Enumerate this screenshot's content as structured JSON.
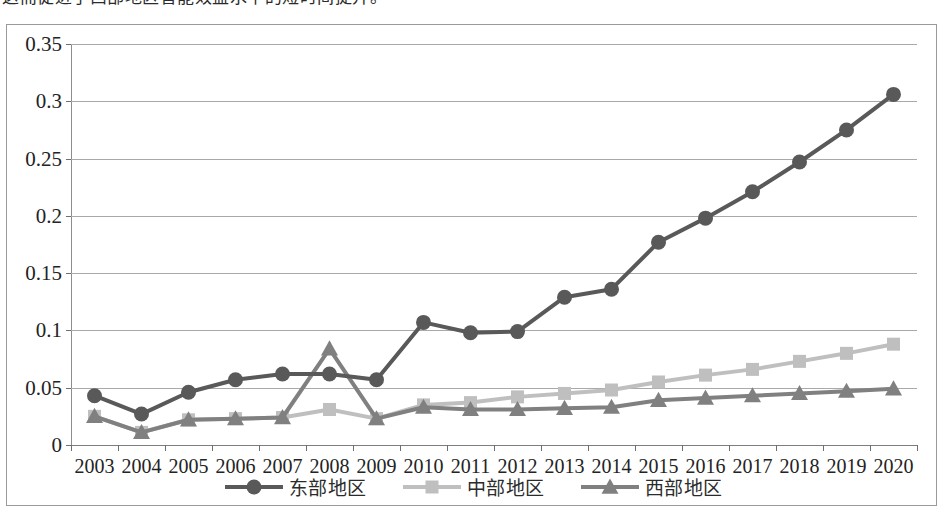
{
  "caption": {
    "text": "这而促进了西部地区智能效益水平的短时间提升。"
  },
  "chart_data": {
    "type": "line",
    "title": "",
    "xlabel": "",
    "ylabel": "",
    "x": [
      2003,
      2004,
      2005,
      2006,
      2007,
      2008,
      2009,
      2010,
      2011,
      2012,
      2013,
      2014,
      2015,
      2016,
      2017,
      2018,
      2019,
      2020
    ],
    "categories": [
      "2003",
      "2004",
      "2005",
      "2006",
      "2007",
      "2008",
      "2009",
      "2010",
      "2011",
      "2012",
      "2013",
      "2014",
      "2015",
      "2016",
      "2017",
      "2018",
      "2019",
      "2020"
    ],
    "ylim": [
      0,
      0.35
    ],
    "ytick_labels": [
      "0",
      "0.05",
      "0.1",
      "0.15",
      "0.2",
      "0.25",
      "0.3",
      "0.35"
    ],
    "ytick_values": [
      0,
      0.05,
      0.1,
      0.15,
      0.2,
      0.25,
      0.3,
      0.35
    ],
    "grid": true,
    "legend_position": "bottom",
    "series": [
      {
        "name": "东部地区",
        "marker": "circle",
        "color": "#595959",
        "values": [
          0.043,
          0.027,
          0.046,
          0.057,
          0.062,
          0.062,
          0.057,
          0.107,
          0.098,
          0.099,
          0.129,
          0.136,
          0.177,
          0.198,
          0.221,
          0.247,
          0.275,
          0.306
        ]
      },
      {
        "name": "中部地区",
        "marker": "square",
        "color": "#bfbfbf",
        "values": [
          0.025,
          0.011,
          0.022,
          0.023,
          0.024,
          0.031,
          0.023,
          0.035,
          0.037,
          0.042,
          0.045,
          0.048,
          0.055,
          0.061,
          0.066,
          0.073,
          0.08,
          0.088
        ]
      },
      {
        "name": "西部地区",
        "marker": "triangle",
        "color": "#808080",
        "values": [
          0.025,
          0.011,
          0.022,
          0.023,
          0.024,
          0.084,
          0.023,
          0.033,
          0.031,
          0.031,
          0.032,
          0.033,
          0.039,
          0.041,
          0.043,
          0.045,
          0.047,
          0.049
        ]
      }
    ]
  },
  "colors": {
    "east": "#595959",
    "central": "#bfbfbf",
    "west": "#808080",
    "grid": "#a9a9a9",
    "axis": "#7e7e7e",
    "frame": "#9a9a9a"
  }
}
